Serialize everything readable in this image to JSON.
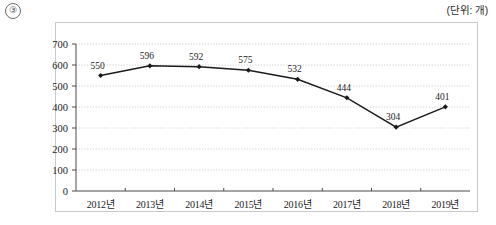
{
  "figure": {
    "index_label": "③",
    "unit_note": "(단위: 개)"
  },
  "chart_data": {
    "type": "line",
    "title": "",
    "xlabel": "",
    "ylabel": "",
    "unit": "개",
    "categories": [
      "2012년",
      "2013년",
      "2014년",
      "2015년",
      "2016년",
      "2017년",
      "2018년",
      "2019년"
    ],
    "values": [
      550,
      596,
      592,
      575,
      532,
      444,
      304,
      401
    ],
    "point_labels": [
      "550",
      "596",
      "592",
      "575",
      "532",
      "444",
      "304",
      "401"
    ],
    "ylim": [
      0,
      700
    ],
    "yticks": [
      0,
      100,
      200,
      300,
      400,
      500,
      600,
      700
    ],
    "ytick_labels": [
      "0",
      "100",
      "200",
      "300",
      "400",
      "500",
      "600",
      "700"
    ],
    "grid": true,
    "grid_style": "dotted",
    "legend": "none",
    "series_color": "#1a1a1a",
    "marker": "diamond",
    "grid_color": "#cfcfcf",
    "axis_color": "#4a4a4a"
  }
}
